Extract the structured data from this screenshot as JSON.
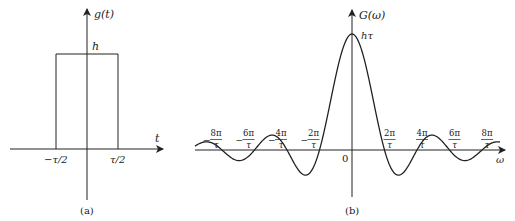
{
  "figure_a": {
    "y_label": "g(t)",
    "x_label": "t",
    "height_label": "h",
    "left_edge_label": "−τ/2",
    "right_edge_label": "τ/2",
    "caption": "(a)"
  },
  "figure_b": {
    "y_label": "G(ω)",
    "x_label": "ω",
    "peak_label": "hτ",
    "origin_label": "0",
    "caption": "(b)",
    "tick_labels": [
      {
        "sign": "−",
        "num": "8π",
        "den": "τ"
      },
      {
        "sign": "−",
        "num": "6π",
        "den": "τ"
      },
      {
        "sign": "−",
        "num": "4π",
        "den": "τ"
      },
      {
        "sign": "−",
        "num": "2π",
        "den": "τ"
      },
      {
        "sign": "",
        "num": "2π",
        "den": "τ"
      },
      {
        "sign": "",
        "num": "4π",
        "den": "τ"
      },
      {
        "sign": "",
        "num": "6π",
        "den": "τ"
      },
      {
        "sign": "",
        "num": "8π",
        "den": "τ"
      }
    ]
  },
  "colors": {
    "line": "#222222",
    "background": "#ffffff"
  }
}
